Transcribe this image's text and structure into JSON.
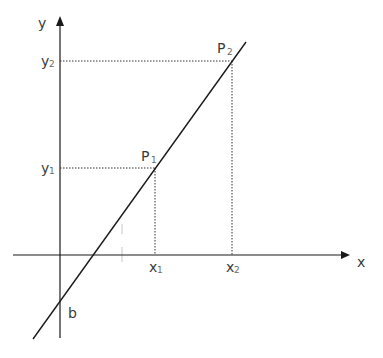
{
  "diagram": {
    "type": "linear-function-two-points",
    "axes": {
      "x_label": "x",
      "y_label": "y"
    },
    "points": [
      {
        "id": "P1",
        "label": "P",
        "subscript": "1",
        "x_label": "x",
        "x_sub": "1",
        "y_label": "y",
        "y_sub": "1"
      },
      {
        "id": "P2",
        "label": "P",
        "subscript": "2",
        "x_label": "x",
        "x_sub": "2",
        "y_label": "y",
        "y_sub": "2"
      }
    ],
    "intercept_label": "b",
    "colors": {
      "line": "#1a1a1a",
      "axis": "#1a1a1a",
      "guide": "#333333",
      "text": "#3a3a3a"
    }
  }
}
